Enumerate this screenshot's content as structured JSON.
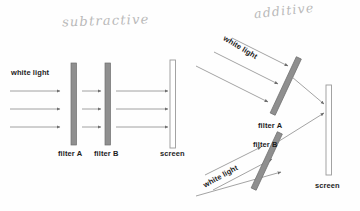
{
  "figure": {
    "background_color": "#fefefe",
    "label_color": "#1d1d1d",
    "filter_fill": "#8f8f8f",
    "filter_stroke": "#6e6e6e",
    "screen_fill": "#ffffff",
    "screen_stroke": "#9a9a9a",
    "ray_color": "#8c8c8c",
    "handwriting_color": "#b9b9b9"
  },
  "annotations": {
    "subtractive": "subtractive",
    "additive": "additive"
  },
  "left_panel": {
    "name": "subtractive-color-diagram",
    "source_label": "white light",
    "filter_a_label": "filter A",
    "filter_b_label": "filter B",
    "screen_label": "screen",
    "ray_count": 3
  },
  "right_panel": {
    "name": "additive-color-diagram",
    "source_label_top": "white light",
    "source_label_bottom": "white light",
    "filter_a_label": "filter A",
    "filter_b_label": "filter B",
    "screen_label": "screen",
    "ray_count_top": 3,
    "ray_count_bottom": 3,
    "output_ray_count": 2
  }
}
